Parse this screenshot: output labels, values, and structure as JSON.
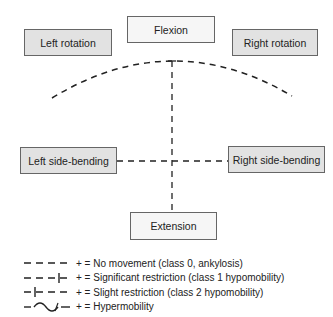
{
  "diagram": {
    "nodes": {
      "flexion": "Flexion",
      "left_rotation": "Left rotation",
      "right_rotation": "Right rotation",
      "left_side_bending": "Left side-bending",
      "right_side_bending": "Right side-bending",
      "extension": "Extension"
    },
    "legend": [
      {
        "symbol": "dashed-line",
        "text": "+ = No movement (class 0, ankylosis)"
      },
      {
        "symbol": "dashed-line-tick-right",
        "text": "+ = Significant restriction (class 1 hypomobility)"
      },
      {
        "symbol": "dashed-line-tick-left",
        "text": "+ = Slight restriction (class 2 hypomobility)"
      },
      {
        "symbol": "wave-line",
        "text": "+ = Hypermobility"
      }
    ],
    "colors": {
      "box_gray": "#e2e2e2",
      "box_light": "#f6f6f6",
      "line": "#222222"
    }
  }
}
